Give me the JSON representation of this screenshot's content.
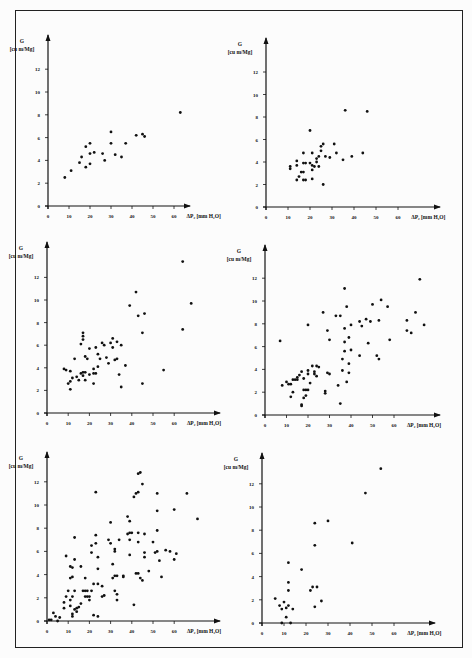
{
  "figure": {
    "panel_count": 6,
    "y_axis_label": "G",
    "y_axis_unit": "[cu m/Mg]",
    "x_axis_label": "ΔP₂ [mm H₂O]",
    "x_ticks": [
      "0",
      "10",
      "20",
      "30",
      "40",
      "50",
      "60"
    ],
    "y_ticks": [
      "0",
      "2",
      "4",
      "6",
      "8",
      "10",
      "12"
    ]
  },
  "chart_data": [
    {
      "type": "scatter",
      "panel": "top-left",
      "xlabel": "ΔP2 [mm H2O]",
      "ylabel": "G [cu m/Mg]",
      "xlim": [
        0,
        70
      ],
      "ylim": [
        0,
        14
      ],
      "grid": false,
      "points": [
        [
          8,
          2.5
        ],
        [
          11,
          3.1
        ],
        [
          15,
          3.8
        ],
        [
          16,
          4.3
        ],
        [
          18,
          3.4
        ],
        [
          18,
          5.2
        ],
        [
          20,
          3.7
        ],
        [
          20,
          4.6
        ],
        [
          20,
          5.5
        ],
        [
          22,
          4.7
        ],
        [
          26,
          4.6
        ],
        [
          27,
          4.0
        ],
        [
          30,
          6.5
        ],
        [
          30,
          5.5
        ],
        [
          32,
          4.5
        ],
        [
          35,
          4.3
        ],
        [
          37,
          5.5
        ],
        [
          42,
          6.2
        ],
        [
          45,
          6.3
        ],
        [
          46,
          6.1
        ],
        [
          63,
          8.2
        ]
      ]
    },
    {
      "type": "scatter",
      "panel": "top-right",
      "xlabel": "ΔP2 [mm H2O]",
      "ylabel": "G [cu m/Mg]",
      "xlim": [
        0,
        70
      ],
      "ylim": [
        0,
        14
      ],
      "grid": false,
      "points": [
        [
          11,
          3.4
        ],
        [
          11,
          3.6
        ],
        [
          14,
          2.4
        ],
        [
          14,
          3.7
        ],
        [
          14,
          4.1
        ],
        [
          15,
          2.7
        ],
        [
          16,
          3.1
        ],
        [
          17,
          3.1
        ],
        [
          17,
          2.4
        ],
        [
          17,
          3.9
        ],
        [
          17,
          4.8
        ],
        [
          18,
          3.9
        ],
        [
          18,
          2.4
        ],
        [
          20,
          3.9
        ],
        [
          20,
          6.8
        ],
        [
          21,
          3.3
        ],
        [
          21,
          2.5
        ],
        [
          21,
          3.7
        ],
        [
          21,
          4.8
        ],
        [
          22,
          3.6
        ],
        [
          23,
          4.0
        ],
        [
          23,
          4.3
        ],
        [
          24,
          3.6
        ],
        [
          24,
          4.5
        ],
        [
          25,
          5.0
        ],
        [
          25,
          5.4
        ],
        [
          26,
          5.6
        ],
        [
          26,
          2.0
        ],
        [
          27,
          4.5
        ],
        [
          29,
          4.4
        ],
        [
          31,
          5.6
        ],
        [
          32,
          4.8
        ],
        [
          35,
          4.2
        ],
        [
          36,
          8.6
        ],
        [
          39,
          4.5
        ],
        [
          44,
          4.8
        ],
        [
          46,
          8.5
        ]
      ]
    },
    {
      "type": "scatter",
      "panel": "middle-left",
      "xlabel": "ΔP2 [mm H2O]",
      "ylabel": "G [cu m/Mg]",
      "xlim": [
        0,
        70
      ],
      "ylim": [
        0,
        14
      ],
      "grid": false,
      "points": [
        [
          8,
          3.9
        ],
        [
          9,
          3.8
        ],
        [
          10,
          2.6
        ],
        [
          11,
          2.8
        ],
        [
          11,
          2.1
        ],
        [
          11,
          3.7
        ],
        [
          12,
          3.1
        ],
        [
          13,
          4.8
        ],
        [
          14,
          3.2
        ],
        [
          15,
          2.9
        ],
        [
          16,
          3.5
        ],
        [
          16,
          6.1
        ],
        [
          17,
          3.6
        ],
        [
          17,
          3.3
        ],
        [
          17,
          6.5
        ],
        [
          17,
          6.8
        ],
        [
          17,
          7.1
        ],
        [
          18,
          3.6
        ],
        [
          18,
          2.9
        ],
        [
          18,
          5.0
        ],
        [
          19,
          4.8
        ],
        [
          20,
          3.4
        ],
        [
          20,
          5.7
        ],
        [
          22,
          2.6
        ],
        [
          22,
          3.9
        ],
        [
          22,
          3.5
        ],
        [
          23,
          3.5
        ],
        [
          23,
          5.8
        ],
        [
          24,
          4.1
        ],
        [
          24,
          5.2
        ],
        [
          25,
          4.8
        ],
        [
          26,
          6.2
        ],
        [
          27,
          6.0
        ],
        [
          28,
          4.9
        ],
        [
          29,
          4.4
        ],
        [
          30,
          6.2
        ],
        [
          31,
          5.8
        ],
        [
          31,
          6.6
        ],
        [
          32,
          4.7
        ],
        [
          33,
          4.8
        ],
        [
          33,
          6.3
        ],
        [
          34,
          3.4
        ],
        [
          35,
          2.3
        ],
        [
          35,
          6.0
        ],
        [
          37,
          4.2
        ],
        [
          39,
          9.5
        ],
        [
          42,
          10.7
        ],
        [
          43,
          8.6
        ],
        [
          45,
          2.6
        ],
        [
          45,
          7.1
        ],
        [
          46,
          8.8
        ],
        [
          55,
          3.8
        ],
        [
          64,
          7.4
        ],
        [
          64,
          13.4
        ],
        [
          68,
          9.7
        ]
      ]
    },
    {
      "type": "scatter",
      "panel": "middle-right",
      "xlabel": "ΔP2 [mm H2O]",
      "ylabel": "G [cu m/Mg]",
      "xlim": [
        0,
        70
      ],
      "ylim": [
        0,
        14
      ],
      "grid": false,
      "points": [
        [
          7,
          6.5
        ],
        [
          8,
          2.6
        ],
        [
          10,
          2.9
        ],
        [
          11,
          2.7
        ],
        [
          12,
          2.7
        ],
        [
          12,
          1.6
        ],
        [
          13,
          2.0
        ],
        [
          13,
          3.1
        ],
        [
          14,
          3.1
        ],
        [
          15,
          3.1
        ],
        [
          15,
          3.3
        ],
        [
          16,
          3.5
        ],
        [
          17,
          0.8
        ],
        [
          17,
          0.9
        ],
        [
          17,
          3.8
        ],
        [
          18,
          1.5
        ],
        [
          18,
          2.2
        ],
        [
          18,
          3.2
        ],
        [
          19,
          1.7
        ],
        [
          19,
          2.2
        ],
        [
          20,
          2.2
        ],
        [
          20,
          3.6
        ],
        [
          20,
          3.9
        ],
        [
          20,
          7.9
        ],
        [
          21,
          2.8
        ],
        [
          22,
          4.3
        ],
        [
          23,
          3.6
        ],
        [
          23,
          3.8
        ],
        [
          24,
          3.4
        ],
        [
          24,
          4.3
        ],
        [
          25,
          4.2
        ],
        [
          27,
          9.0
        ],
        [
          28,
          1.9
        ],
        [
          28,
          2.1
        ],
        [
          29,
          3.7
        ],
        [
          29,
          7.4
        ],
        [
          30,
          3.6
        ],
        [
          30,
          6.6
        ],
        [
          33,
          8.7
        ],
        [
          34,
          2.6
        ],
        [
          35,
          1.0
        ],
        [
          35,
          8.7
        ],
        [
          36,
          3.9
        ],
        [
          36,
          4.9
        ],
        [
          37,
          5.6
        ],
        [
          37,
          6.4
        ],
        [
          37,
          7.6
        ],
        [
          37,
          11.1
        ],
        [
          38,
          2.9
        ],
        [
          38,
          9.5
        ],
        [
          39,
          3.7
        ],
        [
          39,
          4.5
        ],
        [
          39,
          6.8
        ],
        [
          40,
          5.7
        ],
        [
          40,
          7.9
        ],
        [
          44,
          8.2
        ],
        [
          44,
          5.2
        ],
        [
          45,
          7.8
        ],
        [
          47,
          8.4
        ],
        [
          48,
          6.3
        ],
        [
          49,
          8.2
        ],
        [
          50,
          9.7
        ],
        [
          52,
          5.2
        ],
        [
          53,
          4.9
        ],
        [
          53,
          8.3
        ],
        [
          54,
          10.1
        ],
        [
          57,
          9.5
        ],
        [
          58,
          6.6
        ],
        [
          66,
          7.4
        ],
        [
          66,
          8.3
        ],
        [
          68,
          7.2
        ],
        [
          70,
          9.0
        ],
        [
          72,
          11.9
        ],
        [
          74,
          7.9
        ]
      ]
    },
    {
      "type": "scatter",
      "panel": "bottom-left",
      "xlabel": "ΔP2 [mm H2O]",
      "ylabel": "G [cu m/Mg]",
      "xlim": [
        0,
        70
      ],
      "ylim": [
        0,
        14
      ],
      "grid": false,
      "points": [
        [
          1,
          0.1
        ],
        [
          2,
          0.1
        ],
        [
          3,
          0.7
        ],
        [
          4,
          0.4
        ],
        [
          5,
          0.0
        ],
        [
          6,
          0.3
        ],
        [
          8,
          1.1
        ],
        [
          8,
          1.6
        ],
        [
          9,
          2.1
        ],
        [
          9,
          5.6
        ],
        [
          10,
          2.6
        ],
        [
          11,
          1.3
        ],
        [
          11,
          1.8
        ],
        [
          11,
          3.7
        ],
        [
          11,
          4.7
        ],
        [
          12,
          0.4
        ],
        [
          12,
          0.6
        ],
        [
          12,
          2.1
        ],
        [
          12,
          3.8
        ],
        [
          12,
          4.6
        ],
        [
          13,
          1.0
        ],
        [
          13,
          2.6
        ],
        [
          13,
          5.3
        ],
        [
          13,
          7.2
        ],
        [
          14,
          0.8
        ],
        [
          14,
          1.1
        ],
        [
          15,
          1.2
        ],
        [
          16,
          1.5
        ],
        [
          16,
          4.7
        ],
        [
          17,
          2.6
        ],
        [
          18,
          2.1
        ],
        [
          18,
          3.7
        ],
        [
          18,
          2.6
        ],
        [
          19,
          2.1
        ],
        [
          19,
          2.6
        ],
        [
          20,
          1.8
        ],
        [
          20,
          2.1
        ],
        [
          21,
          2.6
        ],
        [
          21,
          5.9
        ],
        [
          21,
          6.5
        ],
        [
          22,
          0.5
        ],
        [
          22,
          3.2
        ],
        [
          23,
          6.7
        ],
        [
          23,
          7.4
        ],
        [
          23,
          11.1
        ],
        [
          24,
          0.4
        ],
        [
          24,
          3.2
        ],
        [
          24,
          4.5
        ],
        [
          24,
          5.5
        ],
        [
          26,
          2.1
        ],
        [
          26,
          3.0
        ],
        [
          27,
          2.2
        ],
        [
          29,
          7.0
        ],
        [
          30,
          6.7
        ],
        [
          30,
          8.5
        ],
        [
          31,
          3.7
        ],
        [
          31,
          4.9
        ],
        [
          32,
          2.6
        ],
        [
          32,
          3.9
        ],
        [
          32,
          6.0
        ],
        [
          32,
          6.2
        ],
        [
          33,
          1.8
        ],
        [
          33,
          2.3
        ],
        [
          33,
          3.9
        ],
        [
          34,
          7.0
        ],
        [
          36,
          3.9
        ],
        [
          36,
          3.8
        ],
        [
          38,
          7.5
        ],
        [
          38,
          9.0
        ],
        [
          39,
          5.7
        ],
        [
          39,
          7.0
        ],
        [
          39,
          7.6
        ],
        [
          39,
          8.6
        ],
        [
          40,
          7.6
        ],
        [
          41,
          1.4
        ],
        [
          41,
          10.7
        ],
        [
          42,
          4.1
        ],
        [
          42,
          11.0
        ],
        [
          43,
          4.1
        ],
        [
          43,
          6.8
        ],
        [
          43,
          7.6
        ],
        [
          43,
          11.1
        ],
        [
          43,
          12.7
        ],
        [
          44,
          3.7
        ],
        [
          44,
          12.8
        ],
        [
          45,
          3.5
        ],
        [
          45,
          11.8
        ],
        [
          46,
          7.5
        ],
        [
          46,
          5.5
        ],
        [
          46,
          5.9
        ],
        [
          48,
          4.3
        ],
        [
          50,
          6.8
        ],
        [
          51,
          5.9
        ],
        [
          52,
          6.0
        ],
        [
          52,
          7.8
        ],
        [
          52,
          9.5
        ],
        [
          52,
          11.0
        ],
        [
          53,
          5.2
        ],
        [
          54,
          3.8
        ],
        [
          56,
          6.1
        ],
        [
          58,
          6.0
        ],
        [
          60,
          5.3
        ],
        [
          60,
          9.6
        ],
        [
          61,
          5.8
        ],
        [
          66,
          11.0
        ],
        [
          71,
          8.8
        ]
      ]
    },
    {
      "type": "scatter",
      "panel": "bottom-right",
      "xlabel": "ΔP2 [mm H2O]",
      "ylabel": "G [cu m/Mg]",
      "xlim": [
        0,
        70
      ],
      "ylim": [
        0,
        14
      ],
      "grid": false,
      "points": [
        [
          6,
          2.1
        ],
        [
          8,
          1.5
        ],
        [
          9,
          0.0
        ],
        [
          9,
          1.2
        ],
        [
          10,
          1.8
        ],
        [
          11,
          0.5
        ],
        [
          11,
          1.3
        ],
        [
          12,
          1.5
        ],
        [
          12,
          2.8
        ],
        [
          12,
          3.5
        ],
        [
          12,
          5.2
        ],
        [
          13,
          0.0
        ],
        [
          14,
          1.2
        ],
        [
          18,
          4.6
        ],
        [
          22,
          2.8
        ],
        [
          23,
          3.1
        ],
        [
          24,
          1.4
        ],
        [
          24,
          6.7
        ],
        [
          24,
          8.6
        ],
        [
          25,
          3.1
        ],
        [
          27,
          1.9
        ],
        [
          30,
          8.8
        ],
        [
          41,
          6.9
        ],
        [
          47,
          11.2
        ],
        [
          54,
          13.3
        ]
      ]
    }
  ]
}
